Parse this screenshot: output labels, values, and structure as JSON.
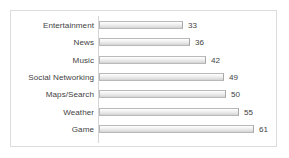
{
  "chart_data": {
    "type": "bar",
    "orientation": "horizontal",
    "title": "",
    "subtitle": "",
    "xlabel": "",
    "ylabel": "",
    "categories": [
      "Entertainment",
      "News",
      "Music",
      "Social Networking",
      "Maps/Search",
      "Weather",
      "Game"
    ],
    "values": [
      33,
      36,
      42,
      49,
      50,
      55,
      61
    ],
    "data_labels": [
      "33",
      "36",
      "42",
      "49",
      "50",
      "55",
      "61"
    ],
    "xlim": [
      0,
      61
    ],
    "grid": false,
    "legend": null,
    "legend_position": "none",
    "axis_ticks": [],
    "series": [
      {
        "name": "",
        "values": [
          33,
          36,
          42,
          49,
          50,
          55,
          61
        ]
      }
    ]
  },
  "style": {
    "bar_fill_light": "#ffffff",
    "bar_fill_dark": "#d2d2d2",
    "bar_border": "#b9b9b9",
    "axis_line": "#d4d4d4",
    "frame_border": "#dcdcdc",
    "text_color": "#3f3f3f",
    "background": "#ffffff"
  }
}
